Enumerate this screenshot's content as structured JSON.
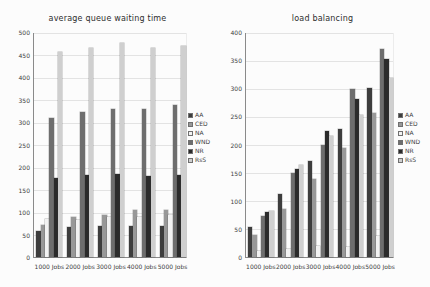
{
  "page": {
    "background": "#fcfcfc"
  },
  "chart_data": [
    {
      "type": "bar",
      "title": "average queue waiting time",
      "categories": [
        "1000 Jobs",
        "2000 Jobs",
        "3000 Jobs",
        "4000 Jobs",
        "5000 Jobs"
      ],
      "series": [
        {
          "name": "AA",
          "color": "#3d3d3d",
          "values": [
            58,
            66,
            68,
            70,
            68
          ]
        },
        {
          "name": "CED",
          "color": "#989898",
          "values": [
            72,
            88,
            93,
            105,
            104
          ]
        },
        {
          "name": "NA",
          "color": "#f2f2f2",
          "values": [
            85,
            83,
            90,
            88,
            94
          ]
        },
        {
          "name": "WND",
          "color": "#6e6e6e",
          "values": [
            310,
            322,
            330,
            330,
            337
          ]
        },
        {
          "name": "NR",
          "color": "#2b2b2b",
          "values": [
            175,
            182,
            184,
            181,
            182
          ]
        },
        {
          "name": "RsS",
          "color": "#cfcfcf",
          "values": [
            455,
            465,
            475,
            465,
            470
          ]
        }
      ],
      "xlabel": "",
      "ylabel": "",
      "ylim": [
        0,
        500
      ],
      "ytick_step": 50,
      "grid": true,
      "legend_position": "right"
    },
    {
      "type": "bar",
      "title": "load balancing",
      "categories": [
        "1000 Jobs",
        "2000 Jobs",
        "3000 Jobs",
        "4000 Jobs",
        "5000 Jobs"
      ],
      "series": [
        {
          "name": "AA",
          "color": "#3d3d3d",
          "values": [
            54,
            112,
            170,
            227,
            300
          ]
        },
        {
          "name": "CED",
          "color": "#989898",
          "values": [
            40,
            85,
            138,
            194,
            256
          ]
        },
        {
          "name": "NA",
          "color": "#f2f2f2",
          "values": [
            10,
            15,
            19,
            18,
            38
          ]
        },
        {
          "name": "WND",
          "color": "#6e6e6e",
          "values": [
            73,
            150,
            200,
            298,
            370
          ]
        },
        {
          "name": "NR",
          "color": "#2b2b2b",
          "values": [
            80,
            157,
            224,
            281,
            352
          ]
        },
        {
          "name": "RsS",
          "color": "#cfcfcf",
          "values": [
            82,
            164,
            216,
            252,
            318
          ]
        }
      ],
      "xlabel": "",
      "ylabel": "",
      "ylim": [
        0,
        400
      ],
      "ytick_step": 50,
      "grid": true,
      "legend_position": "right"
    }
  ]
}
